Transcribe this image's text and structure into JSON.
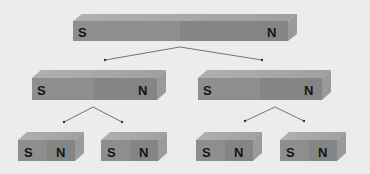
{
  "diagram": {
    "colors": {
      "background": "#ececec",
      "front_south": "#8e8e8e",
      "front_north": "#858585",
      "top_face": "#a8a8a8",
      "side_face": "#9a9a9a",
      "line": "#555555",
      "text": "#141414"
    },
    "magnets": [
      {
        "id": "top",
        "level": 1,
        "south_label": "S",
        "north_label": "N"
      },
      {
        "id": "mid-left",
        "level": 2,
        "south_label": "S",
        "north_label": "N"
      },
      {
        "id": "mid-right",
        "level": 2,
        "south_label": "S",
        "north_label": "N"
      },
      {
        "id": "bottom-1",
        "level": 3,
        "south_label": "S",
        "north_label": "N"
      },
      {
        "id": "bottom-2",
        "level": 3,
        "south_label": "S",
        "north_label": "N"
      },
      {
        "id": "bottom-3",
        "level": 3,
        "south_label": "S",
        "north_label": "N"
      },
      {
        "id": "bottom-4",
        "level": 3,
        "south_label": "S",
        "north_label": "N"
      }
    ]
  }
}
